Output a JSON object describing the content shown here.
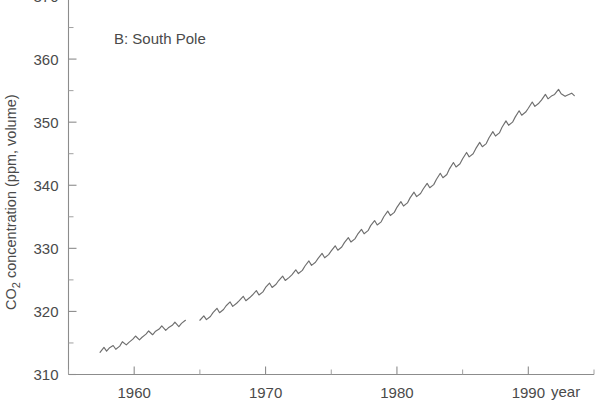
{
  "figure": {
    "panel_label": "B: South Pole",
    "background": "#ffffff",
    "line_color": "#6f6f6f",
    "axis_color": "#8c8c8c",
    "text_color": "#4a4a4a"
  },
  "axes": {
    "y_title": "CO",
    "y_title_sub": "2",
    "y_title_rest": " concentration (ppm, volume)",
    "x_unit_label": "year",
    "y_ticks": [
      "310",
      "320",
      "330",
      "340",
      "350",
      "360",
      "370"
    ],
    "x_ticks": [
      "1960",
      "1970",
      "1980",
      "1990"
    ]
  },
  "chart_data": {
    "type": "line",
    "title": "B: South Pole",
    "xlabel": "year",
    "ylabel": "CO2 concentration (ppm, volume)",
    "xlim": [
      1955,
      1995
    ],
    "ylim": [
      310,
      370
    ],
    "y_major_ticks": [
      310,
      320,
      330,
      340,
      350,
      360,
      370
    ],
    "y_minor_ticks": [
      315,
      325,
      335,
      345,
      355,
      365
    ],
    "x_major_ticks": [
      1960,
      1970,
      1980,
      1990
    ],
    "x_minor_ticks": [
      1955,
      1965,
      1975,
      1985,
      1995
    ],
    "grid": false,
    "legend": null,
    "annotations": [
      {
        "text": "B: South Pole",
        "x": 1959.5,
        "y": 364.5
      }
    ],
    "series": [
      {
        "name": "South Pole CO2 (segment 1)",
        "gap_after": true,
        "x": [
          1957.4,
          1957.7,
          1957.9,
          1958.1,
          1958.4,
          1958.6,
          1958.9,
          1959.1,
          1959.4,
          1959.6,
          1959.9,
          1960.1,
          1960.4,
          1960.6,
          1960.9,
          1961.1,
          1961.4,
          1961.6,
          1961.9,
          1962.1,
          1962.4,
          1962.6,
          1962.9,
          1963.1,
          1963.4,
          1963.6,
          1963.9
        ],
        "y": [
          313.5,
          314.3,
          313.7,
          314.2,
          314.6,
          314.0,
          314.5,
          315.2,
          314.7,
          315.1,
          315.6,
          316.1,
          315.5,
          315.9,
          316.4,
          316.9,
          316.3,
          316.8,
          317.2,
          317.7,
          317.0,
          317.4,
          317.8,
          318.3,
          317.6,
          318.1,
          318.6
        ]
      },
      {
        "name": "South Pole CO2 (segment 2)",
        "gap_after": false,
        "x": [
          1965.0,
          1965.3,
          1965.5,
          1965.8,
          1966.0,
          1966.3,
          1966.5,
          1966.8,
          1967.0,
          1967.3,
          1967.5,
          1967.8,
          1968.0,
          1968.3,
          1968.5,
          1968.8,
          1969.0,
          1969.3,
          1969.5,
          1969.8,
          1970.0,
          1970.3,
          1970.5,
          1970.8,
          1971.0,
          1971.3,
          1971.5,
          1971.8,
          1972.0,
          1972.3,
          1972.5,
          1972.8,
          1973.0,
          1973.3,
          1973.5,
          1973.8,
          1974.0,
          1974.3,
          1974.5,
          1974.8,
          1975.0,
          1975.3,
          1975.5,
          1975.8,
          1976.0,
          1976.3,
          1976.5,
          1976.8,
          1977.0,
          1977.3,
          1977.5,
          1977.8,
          1978.0,
          1978.3,
          1978.5,
          1978.8,
          1979.0,
          1979.3,
          1979.5,
          1979.8,
          1980.0,
          1980.3,
          1980.5,
          1980.8,
          1981.0,
          1981.3,
          1981.5,
          1981.8,
          1982.0,
          1982.3,
          1982.5,
          1982.8,
          1983.0,
          1983.3,
          1983.5,
          1983.8,
          1984.0,
          1984.3,
          1984.5,
          1984.8,
          1985.0,
          1985.3,
          1985.5,
          1985.8,
          1986.0,
          1986.3,
          1986.5,
          1986.8,
          1987.0,
          1987.3,
          1987.5,
          1987.8,
          1988.0,
          1988.3,
          1988.5,
          1988.8,
          1989.0,
          1989.3,
          1989.5,
          1989.8,
          1990.0,
          1990.3,
          1990.5,
          1990.8,
          1991.0,
          1991.3,
          1991.5,
          1991.8,
          1992.0,
          1992.3,
          1992.5,
          1992.8,
          1993.0,
          1993.3,
          1993.5
        ],
        "y": [
          318.6,
          319.3,
          318.7,
          319.2,
          319.8,
          320.5,
          319.8,
          320.3,
          320.9,
          321.5,
          320.8,
          321.3,
          321.7,
          322.4,
          321.7,
          322.2,
          322.6,
          323.3,
          322.6,
          323.1,
          323.8,
          324.5,
          323.8,
          324.3,
          324.9,
          325.6,
          324.9,
          325.4,
          325.8,
          326.6,
          326.0,
          326.5,
          327.2,
          328.0,
          327.3,
          327.8,
          328.4,
          329.2,
          328.5,
          329.0,
          329.6,
          330.4,
          329.7,
          330.2,
          330.9,
          331.7,
          331.0,
          331.5,
          332.2,
          333.0,
          332.3,
          332.8,
          333.6,
          334.4,
          333.7,
          334.2,
          335.0,
          335.9,
          335.2,
          335.7,
          336.5,
          337.4,
          336.7,
          337.2,
          338.0,
          338.9,
          338.2,
          338.7,
          339.4,
          340.3,
          339.6,
          340.1,
          340.9,
          341.9,
          341.2,
          341.7,
          342.6,
          343.6,
          342.9,
          343.4,
          344.2,
          345.2,
          344.5,
          345.0,
          345.8,
          346.8,
          346.1,
          346.6,
          347.5,
          348.5,
          347.8,
          348.3,
          349.2,
          350.2,
          349.5,
          350.0,
          350.8,
          351.8,
          351.1,
          351.6,
          352.2,
          353.2,
          352.5,
          353.0,
          353.5,
          354.4,
          353.7,
          354.2,
          354.4,
          355.2,
          354.5,
          354.1,
          354.3,
          354.6,
          354.2
        ]
      }
    ]
  }
}
